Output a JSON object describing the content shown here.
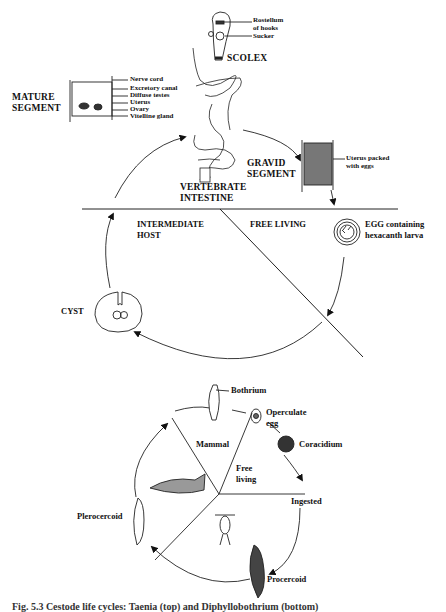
{
  "diagram_top": {
    "title_context": "Taenia (tapeworm) life cycle",
    "scolex": {
      "label": "SCOLEX",
      "parts": [
        "Rostellum",
        "of hooks",
        "Sucker"
      ]
    },
    "mature_segment": {
      "label_line1": "MATURE",
      "label_line2": "SEGMENT",
      "parts": [
        "Nerve cord",
        "Excretory canal",
        "Diffuse testes",
        "Uterus",
        "Ovary",
        "Vitelline gland"
      ]
    },
    "gravid_segment": {
      "label_line1": "GRAVID",
      "label_line2": "SEGMENT",
      "part_line1": "Uterus packed",
      "part_line2": "with eggs"
    },
    "host": {
      "line1": "VERTEBRATE",
      "line2": "INTESTINE"
    },
    "regions": {
      "intermediate_line1": "INTERMEDIATE",
      "intermediate_line2": "HOST",
      "free_living": "FREE LIVING"
    },
    "egg": {
      "line1": "EGG containing",
      "line2": "hexacanth larva"
    },
    "cyst": "CYST"
  },
  "diagram_bottom": {
    "title_context": "Diphyllobothrium life cycle",
    "bothrium": "Bothrium",
    "operculate_egg_line1": "Operculate",
    "operculate_egg_line2": "egg",
    "coracidium": "Coracidium",
    "mammal": "Mammal",
    "free_living_line1": "Free",
    "free_living_line2": "living",
    "ingested": "Ingested",
    "plerocercoid": "Plerocercoid",
    "procercoid": "Procercoid"
  },
  "caption": {
    "text": "Fig. 5.3 Cestode life cycles: Taenia (top) and Diphyllobothrium (bottom)"
  }
}
